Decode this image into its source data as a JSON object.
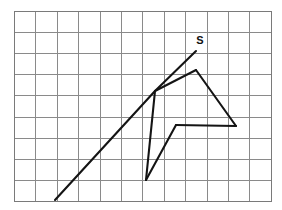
{
  "figure": {
    "background_color": "#ffffff",
    "grid": {
      "origin_x": 14,
      "origin_y": 11,
      "cell_size_x": 21.4,
      "cell_size_y": 21.1,
      "columns": 12,
      "rows": 9,
      "line_color": "#8a8a8a",
      "border_color": "#7a7a7a"
    },
    "stroke_color": "#141414",
    "stroke_width": 2.1,
    "labels": [
      {
        "text": "S",
        "x": 200,
        "y": 44,
        "anchor": "middle",
        "weight": "bold"
      }
    ],
    "vertices": {
      "ray_start": {
        "x": 55,
        "y": 200
      },
      "junction": {
        "x": 155,
        "y": 91
      },
      "s_point": {
        "x": 196,
        "y": 51
      },
      "apex": {
        "x": 196,
        "y": 70
      },
      "right_corner": {
        "x": 236,
        "y": 126
      },
      "mid_corner": {
        "x": 176,
        "y": 125
      },
      "bottom_point": {
        "x": 146,
        "y": 180
      }
    },
    "segments": [
      {
        "name": "incoming-ray",
        "points": "55,200 155,91"
      },
      {
        "name": "ray-to-s",
        "points": "155,91 196,51"
      },
      {
        "name": "junction-to-apex",
        "points": "155,91 196,70"
      },
      {
        "name": "apex-to-right-corner",
        "points": "196,70 236,126"
      },
      {
        "name": "right-corner-to-mid-corner",
        "points": "236,126 176,125"
      },
      {
        "name": "mid-corner-to-bottom-point",
        "points": "176,125 146,180"
      },
      {
        "name": "bottom-point-to-junction",
        "points": "146,180 155,91"
      }
    ]
  }
}
